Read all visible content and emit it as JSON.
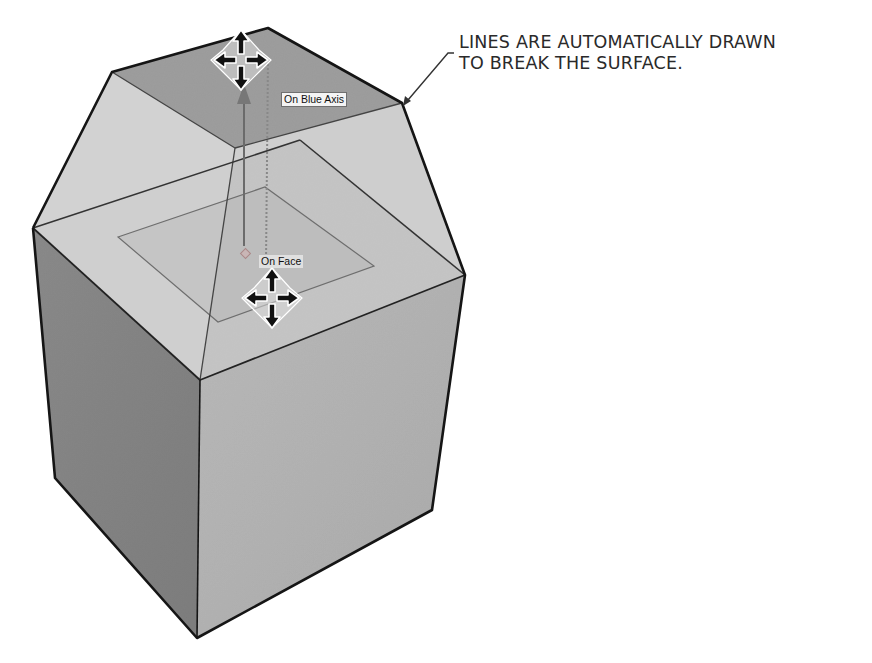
{
  "callout": {
    "lines": [
      "LINES ARE AUTOMATICALLY DRAWN",
      "TO BREAK THE SURFACE."
    ]
  },
  "inference_tips": {
    "blue_axis": "On Blue Axis",
    "face": "On Face"
  },
  "icons": {
    "move_cursor_top": "move-cursor-icon",
    "move_cursor_face": "move-cursor-icon"
  },
  "colors": {
    "top_cap": "#9c9c9c",
    "slope_light": "#cfcfcf",
    "cube_top": "#bdbdbd",
    "cube_left": "#8e8e8e",
    "cube_right": "#b4b4b4",
    "edge": "#1a1a1a"
  }
}
